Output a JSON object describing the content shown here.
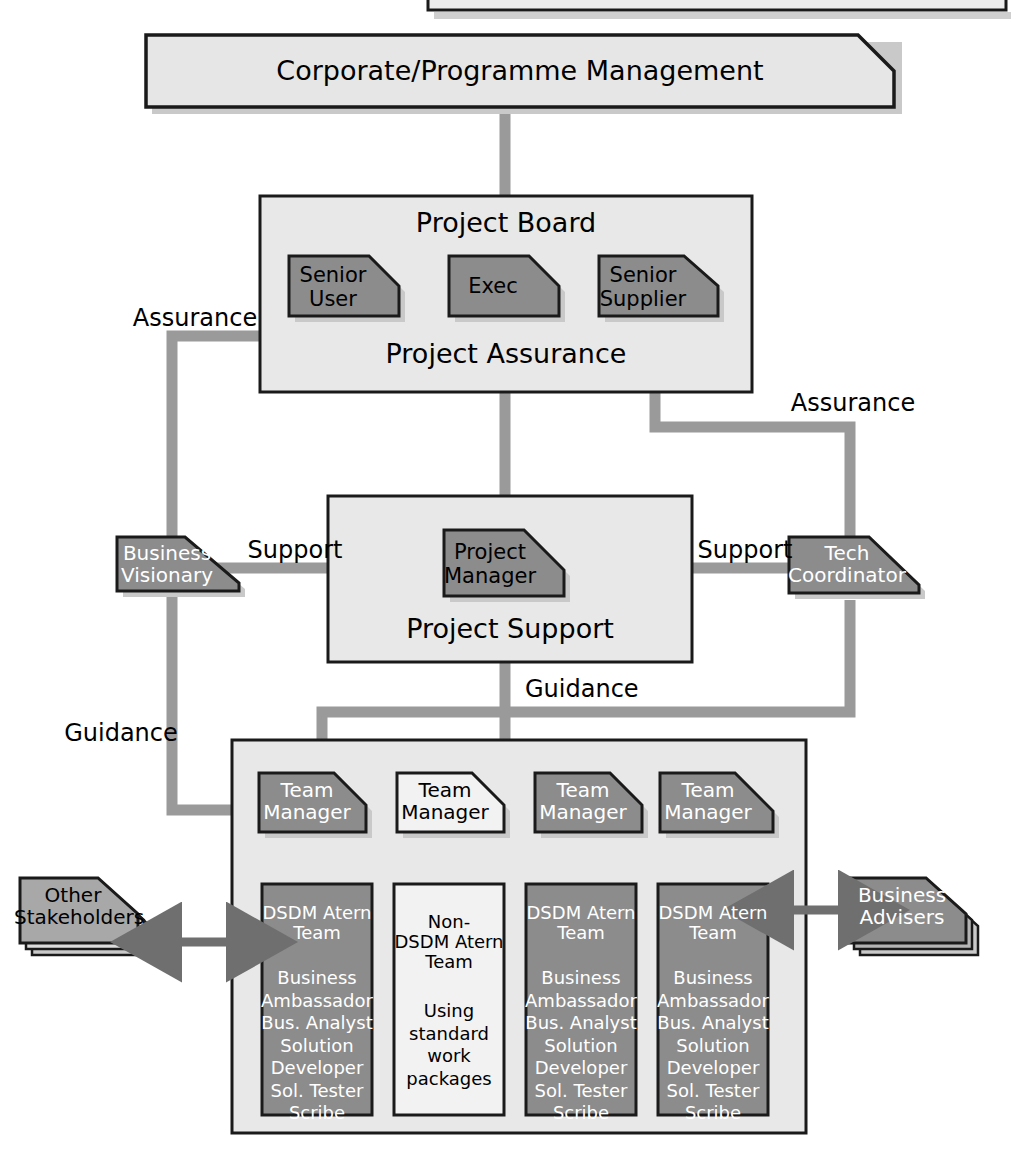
{
  "diagram": {
    "type": "organisation-chart",
    "colors": {
      "dark_fill": "#8c8c8c",
      "light_fill": "#e4e4e4",
      "panel_fill": "#e8e8e8",
      "white_fill": "#f2f2f2",
      "connector": "#9a9a9a",
      "outline": "#1a1a1a",
      "shadow": "#c6c6c6",
      "text_light": "#ffffff",
      "text_dark": "#000000"
    },
    "top_partial_box": {
      "label": ""
    },
    "corporate": {
      "label": "Corporate/Programme Management"
    },
    "project_board": {
      "title": "Project Board",
      "subtitle": "Project Assurance",
      "roles": [
        {
          "label": "Senior\nUser",
          "fill": "dark"
        },
        {
          "label": "Exec",
          "fill": "dark"
        },
        {
          "label": "Senior\nSupplier",
          "fill": "dark"
        }
      ]
    },
    "project_support": {
      "title": "Project Support",
      "manager": {
        "label": "Project\nManager",
        "fill": "dark"
      }
    },
    "side_roles": {
      "business_visionary": {
        "label": "Business\nVisionary",
        "fill": "dark"
      },
      "tech_coordinator": {
        "label": "Tech\nCoordinator",
        "fill": "dark"
      }
    },
    "connector_labels": {
      "assurance_left": "Assurance",
      "assurance_right": "Assurance",
      "support_left": "Support",
      "support_right": "Support",
      "guidance_centre": "Guidance",
      "guidance_left": "Guidance"
    },
    "team_panel": {
      "managers": [
        {
          "label": "Team\nManager",
          "fill": "dark"
        },
        {
          "label": "Team\nManager",
          "fill": "light"
        },
        {
          "label": "Team\nManager",
          "fill": "dark"
        },
        {
          "label": "Team\nManager",
          "fill": "dark"
        }
      ],
      "teams": [
        {
          "fill": "dark",
          "heading": "DSDM Atern\nTeam",
          "members": "Business\nAmbassador\nBus. Analyst\nSolution\nDeveloper\nSol. Tester\nScribe"
        },
        {
          "fill": "light",
          "heading": "Non-\nDSDM Atern\nTeam",
          "members": "Using\nstandard\nwork\npackages"
        },
        {
          "fill": "dark",
          "heading": "DSDM Atern\nTeam",
          "members": "Business\nAmbassador\nBus. Analyst\nSolution\nDeveloper\nSol. Tester\nScribe"
        },
        {
          "fill": "dark",
          "heading": "DSDM Atern\nTeam",
          "members": "Business\nAmbassador\nBus. Analyst\nSolution\nDeveloper\nSol. Tester\nScribe"
        }
      ]
    },
    "external": {
      "left": {
        "label": "Other\nStakeholders",
        "fill": "dark",
        "text": "dark",
        "stacked": true
      },
      "right": {
        "label": "Business\nAdvisers",
        "fill": "dark",
        "text": "light",
        "stacked": true
      }
    }
  }
}
